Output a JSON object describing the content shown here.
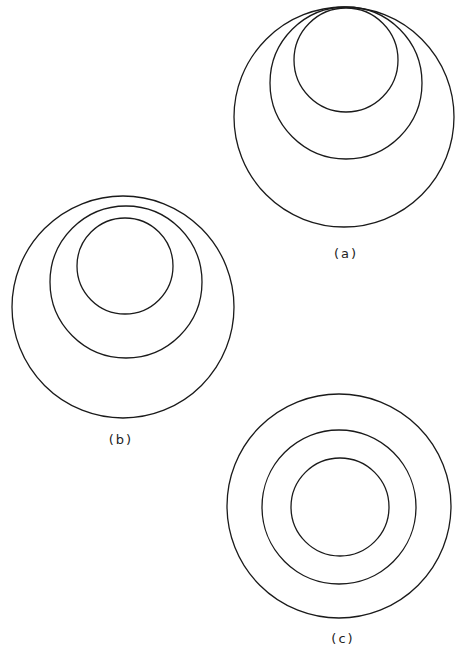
{
  "figures": [
    {
      "id": "a",
      "label": "(a)",
      "label_pos": [
        346,
        258
      ],
      "description": "Three circles internally tangent at a common top point",
      "circles": [
        {
          "cx": 344,
          "cy": 117,
          "r": 110
        },
        {
          "cx": 346,
          "cy": 83,
          "r": 76
        },
        {
          "cx": 346,
          "cy": 60,
          "r": 52
        }
      ]
    },
    {
      "id": "b",
      "label": "(b)",
      "label_pos": [
        121,
        444
      ],
      "description": "Three nested, non-concentric circles offset toward the top",
      "circles": [
        {
          "cx": 123,
          "cy": 307,
          "r": 111
        },
        {
          "cx": 126,
          "cy": 282,
          "r": 76
        },
        {
          "cx": 125,
          "cy": 266,
          "r": 48
        }
      ]
    },
    {
      "id": "c",
      "label": "(c)",
      "label_pos": [
        343,
        643
      ],
      "description": "Three concentric circles",
      "circles": [
        {
          "cx": 339,
          "cy": 506,
          "r": 112
        },
        {
          "cx": 339,
          "cy": 507,
          "r": 77
        },
        {
          "cx": 340,
          "cy": 507,
          "r": 49
        }
      ]
    }
  ]
}
